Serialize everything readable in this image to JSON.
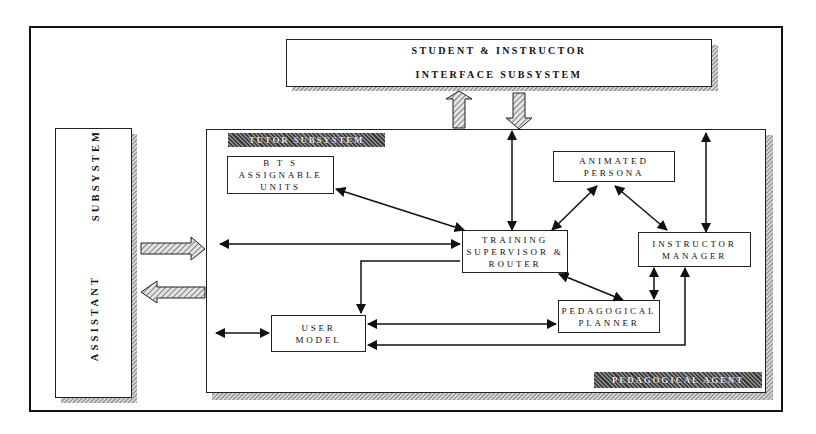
{
  "diagram": {
    "title_box": {
      "line1": "STUDENT & INSTRUCTOR",
      "line2": "INTERFACE SUBSYSTEM"
    },
    "assistant_box": {
      "word1": "ASSISTANT",
      "word2": "SUBSYSTEM"
    },
    "tutor_subsystem": {
      "label": "TUTOR SUBSYSTEM"
    },
    "pedagogical_agent": {
      "label": "PEDAGOGICAL AGENT"
    },
    "nodes": {
      "bts": {
        "label": "B T S\nASSIGNABLE\nUNITS"
      },
      "persona": {
        "label": "ANIMATED\nPERSONA"
      },
      "training": {
        "label": "TRAINING\nSUPERVISOR &\nROUTER"
      },
      "instructor": {
        "label": "INSTRUCTOR\nMANAGER"
      },
      "planner": {
        "label": "PEDAGOGICAL\nPLANNER"
      },
      "user_model": {
        "label": "USER\nMODEL"
      }
    },
    "connections": [
      {
        "from": "training",
        "to": "bts",
        "type": "bidirectional"
      },
      {
        "from": "training",
        "to": "interface",
        "type": "bidirectional"
      },
      {
        "from": "training",
        "to": "persona",
        "type": "bidirectional"
      },
      {
        "from": "persona",
        "to": "instructor",
        "type": "bidirectional"
      },
      {
        "from": "instructor",
        "to": "interface",
        "type": "bidirectional"
      },
      {
        "from": "assistant",
        "to": "training",
        "type": "bidirectional"
      },
      {
        "from": "training",
        "to": "user_model",
        "type": "directed"
      },
      {
        "from": "training",
        "to": "planner",
        "type": "bidirectional"
      },
      {
        "from": "instructor",
        "to": "planner",
        "type": "bidirectional"
      },
      {
        "from": "user_model",
        "to": "planner",
        "type": "bidirectional"
      },
      {
        "from": "instructor",
        "to": "user_model",
        "type": "directed"
      },
      {
        "from": "assistant",
        "to": "user_model",
        "type": "bidirectional"
      },
      {
        "from": "tutor",
        "to": "interface",
        "type": "block-arrow-up"
      },
      {
        "from": "interface",
        "to": "tutor",
        "type": "block-arrow-down"
      },
      {
        "from": "assistant",
        "to": "tutor",
        "type": "block-arrow-right"
      },
      {
        "from": "tutor",
        "to": "assistant",
        "type": "block-arrow-left"
      }
    ]
  }
}
